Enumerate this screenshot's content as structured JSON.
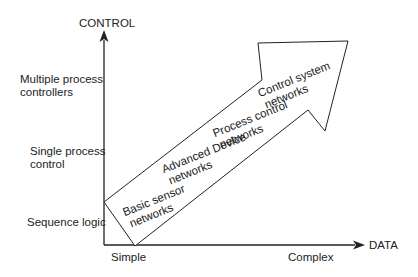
{
  "diagram": {
    "y_axis": {
      "title": "CONTROL",
      "levels": [
        {
          "label_line1": "Multiple process",
          "label_line2": "controllers"
        },
        {
          "label_line1": "Single process",
          "label_line2": "control"
        },
        {
          "label_line1": "Sequence logic",
          "label_line2": ""
        }
      ]
    },
    "x_axis": {
      "title": "DATA",
      "ticks": [
        "Simple",
        "Complex"
      ]
    },
    "arrow_stages": [
      {
        "line1": "Basic sensor",
        "line2": "networks"
      },
      {
        "line1": "Advanced Device",
        "line2": "networks"
      },
      {
        "line1": "Process control",
        "line2": "networks"
      },
      {
        "line1": "Control system",
        "line2": "networks"
      }
    ],
    "colors": {
      "line": "#222222",
      "background": "#ffffff",
      "text": "#222222"
    }
  }
}
